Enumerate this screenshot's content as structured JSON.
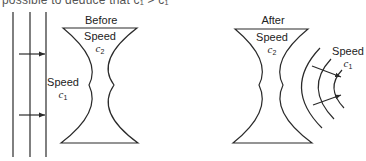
{
  "caption_fragment": "possible to deduce that c₁ > c₁",
  "before_panel": {
    "title": "Before",
    "lens_label": "Speed",
    "lens_symbol": "c",
    "lens_sub": "2",
    "medium_label": "Speed",
    "medium_symbol": "c",
    "medium_sub": "1"
  },
  "after_panel": {
    "title": "After",
    "lens_label": "Speed",
    "lens_symbol": "c",
    "lens_sub": "2",
    "medium_label": "Speed",
    "medium_symbol": "c",
    "medium_sub": "1"
  },
  "colors": {
    "line": "#2a2a2a",
    "background": "#ffffff"
  }
}
